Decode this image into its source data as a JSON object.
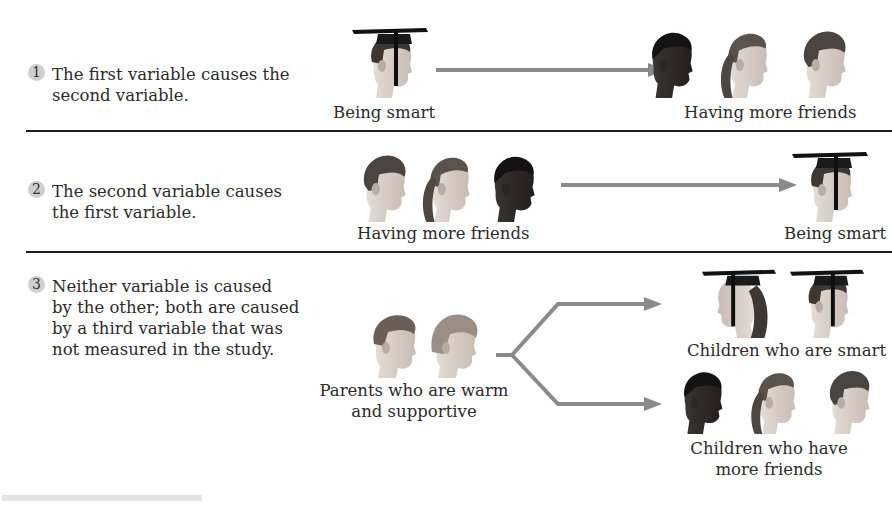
{
  "items": [
    {
      "number": "1",
      "text_lines": [
        "The first variable causes the",
        "second variable."
      ],
      "left_label": "Being smart",
      "right_label": "Having more friends"
    },
    {
      "number": "2",
      "text_lines": [
        "The second variable causes",
        "the first variable."
      ],
      "left_label": "Having more friends",
      "right_label": "Being smart"
    },
    {
      "number": "3",
      "text_lines": [
        "Neither variable is caused",
        "by the other; both are caused",
        "by a third variable that was",
        "not measured in the study."
      ],
      "source_label_lines": [
        "Parents who are warm",
        "and supportive"
      ],
      "target_top_label": "Children who are smart",
      "target_bottom_label_lines": [
        "Children who have",
        "more friends"
      ]
    }
  ],
  "colors": {
    "arrow": "#8a8a8a",
    "divider": "#1e1e1e",
    "number_badge": "#cfcfcf",
    "text": "#2b2b2b"
  },
  "icons": {
    "graduate": "graduate-head-icon",
    "friends": "friends-group-icon",
    "parents": "parents-pair-icon"
  }
}
